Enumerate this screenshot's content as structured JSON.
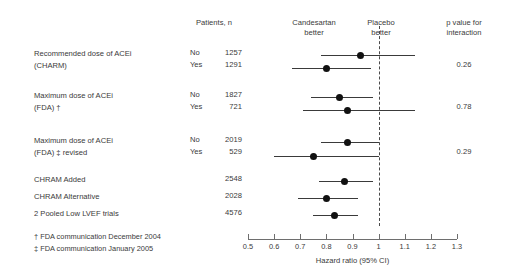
{
  "headers": {
    "patients": "Patients, n",
    "candesartan_better": "Candesartan\nbetter",
    "candesartan_better_l1": "Candesartan",
    "candesartan_better_l2": "better",
    "placebo_better_l1": "Placebo",
    "placebo_better_l2": "better",
    "pvalue_l1": "p value for",
    "pvalue_l2": "interaction"
  },
  "groups": [
    {
      "label_line1": "Recommended dose of ACEi",
      "label_line2": "(CHARM)",
      "pvalue": "0.26",
      "rows": [
        {
          "sub": "No",
          "n": "1257"
        },
        {
          "sub": "Yes",
          "n": "1291"
        }
      ]
    },
    {
      "label_line1": "Maximum dose of ACEi",
      "label_line2": "(FDA) †",
      "pvalue": "0.78",
      "rows": [
        {
          "sub": "No",
          "n": "1827"
        },
        {
          "sub": "Yes",
          "n": "721"
        }
      ]
    },
    {
      "label_line1": "Maximum dose of ACEi",
      "label_line2": "(FDA) ‡ revised",
      "pvalue": "0.29",
      "rows": [
        {
          "sub": "No",
          "n": "2019"
        },
        {
          "sub": "Yes",
          "n": "529"
        }
      ]
    },
    {
      "label_line1": "CHRAM Added",
      "label_line2": "",
      "pvalue": "",
      "rows": [
        {
          "sub": "",
          "n": "2548"
        }
      ]
    },
    {
      "label_line1": "CHRAM Alternative",
      "label_line2": "",
      "pvalue": "",
      "rows": [
        {
          "sub": "",
          "n": "2028"
        }
      ]
    },
    {
      "label_line1": "2 Pooled Low LVEF trials",
      "label_line2": "",
      "pvalue": "",
      "rows": [
        {
          "sub": "",
          "n": "4576"
        }
      ]
    }
  ],
  "footnotes": [
    "† FDA communication December 2004",
    "‡ FDA communication January 2005"
  ],
  "chart_data": {
    "type": "forest",
    "title": "",
    "xlabel": "Hazard ratio (95% CI)",
    "ylabel": "",
    "xlim": [
      0.5,
      1.3
    ],
    "xticks": [
      0.5,
      0.6,
      0.7,
      0.8,
      0.9,
      1.0,
      1.1,
      1.2,
      1.3
    ],
    "xticklabels": [
      "0.5",
      "0.6",
      "0.7",
      "0.8",
      "0.9",
      "1",
      "1.1",
      "1.2",
      "1.3"
    ],
    "reference_line": 1.0,
    "grid": false,
    "left_annotation": "Candesartan better",
    "right_annotation": "Placebo better",
    "points": [
      {
        "label": "Recommended dose of ACEi (CHARM) – No",
        "n": 1257,
        "hr": 0.93,
        "lcl": 0.78,
        "ucl": 1.14,
        "pvalue_interaction": 0.26
      },
      {
        "label": "Recommended dose of ACEi (CHARM) – Yes",
        "n": 1291,
        "hr": 0.8,
        "lcl": 0.67,
        "ucl": 0.97,
        "pvalue_interaction": 0.26
      },
      {
        "label": "Maximum dose of ACEi (FDA) – No",
        "n": 1827,
        "hr": 0.85,
        "lcl": 0.74,
        "ucl": 0.98,
        "pvalue_interaction": 0.78
      },
      {
        "label": "Maximum dose of ACEi (FDA) – Yes",
        "n": 721,
        "hr": 0.88,
        "lcl": 0.71,
        "ucl": 1.14,
        "pvalue_interaction": 0.78
      },
      {
        "label": "Maximum dose of ACEi (FDA) revised – No",
        "n": 2019,
        "hr": 0.88,
        "lcl": 0.78,
        "ucl": 1.0,
        "pvalue_interaction": 0.29
      },
      {
        "label": "Maximum dose of ACEi (FDA) revised – Yes",
        "n": 529,
        "hr": 0.75,
        "lcl": 0.6,
        "ucl": 1.0,
        "pvalue_interaction": 0.29
      },
      {
        "label": "CHRAM Added",
        "n": 2548,
        "hr": 0.87,
        "lcl": 0.77,
        "ucl": 0.98,
        "pvalue_interaction": null
      },
      {
        "label": "CHRAM Alternative",
        "n": 2028,
        "hr": 0.8,
        "lcl": 0.69,
        "ucl": 0.92,
        "pvalue_interaction": null
      },
      {
        "label": "2 Pooled Low LVEF trials",
        "n": 4576,
        "hr": 0.83,
        "lcl": 0.75,
        "ucl": 0.92,
        "pvalue_interaction": null
      }
    ]
  },
  "colors": {
    "text": "#3a3a3a",
    "marker": "#111111",
    "ci": "#3a3a3a",
    "axis": "#6e6e6e",
    "reference": "#4a4a4a"
  }
}
